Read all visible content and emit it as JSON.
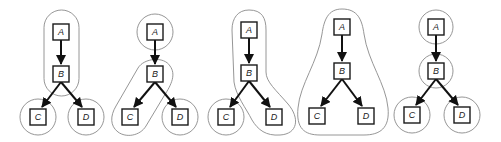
{
  "diagram": {
    "type": "graph-clusterings",
    "colors": {
      "group_outline": "#8a8a8a",
      "node_border": "#1a1a1a",
      "edge": "#111111",
      "label": "#222222"
    },
    "edges": [
      [
        "A",
        "B"
      ],
      [
        "B",
        "C"
      ],
      [
        "B",
        "D"
      ]
    ],
    "panels": [
      {
        "id": "panel-1",
        "groups": [
          [
            "A",
            "B"
          ],
          [
            "C"
          ],
          [
            "D"
          ]
        ],
        "nodes": [
          {
            "id": "A",
            "label": "A",
            "x": 61,
            "y": 32
          },
          {
            "id": "B",
            "label": "B",
            "x": 61,
            "y": 74
          },
          {
            "id": "C",
            "label": "C",
            "x": 38,
            "y": 117
          },
          {
            "id": "D",
            "label": "D",
            "x": 86,
            "y": 117
          }
        ]
      },
      {
        "id": "panel-2",
        "groups": [
          [
            "A"
          ],
          [
            "B",
            "C"
          ],
          [
            "D"
          ]
        ],
        "nodes": [
          {
            "id": "A",
            "label": "A",
            "x": 155,
            "y": 32
          },
          {
            "id": "B",
            "label": "B",
            "x": 155,
            "y": 74
          },
          {
            "id": "C",
            "label": "C",
            "x": 130,
            "y": 117
          },
          {
            "id": "D",
            "label": "D",
            "x": 180,
            "y": 117
          }
        ]
      },
      {
        "id": "panel-3",
        "groups": [
          [
            "A",
            "B",
            "D"
          ],
          [
            "C"
          ]
        ],
        "nodes": [
          {
            "id": "A",
            "label": "A",
            "x": 249,
            "y": 30
          },
          {
            "id": "B",
            "label": "B",
            "x": 249,
            "y": 73
          },
          {
            "id": "C",
            "label": "C",
            "x": 226,
            "y": 117
          },
          {
            "id": "D",
            "label": "D",
            "x": 274,
            "y": 117
          }
        ]
      },
      {
        "id": "panel-4",
        "groups": [
          [
            "A",
            "B",
            "C",
            "D"
          ]
        ],
        "nodes": [
          {
            "id": "A",
            "label": "A",
            "x": 342,
            "y": 27
          },
          {
            "id": "B",
            "label": "B",
            "x": 342,
            "y": 71
          },
          {
            "id": "C",
            "label": "C",
            "x": 317,
            "y": 116
          },
          {
            "id": "D",
            "label": "D",
            "x": 366,
            "y": 116
          }
        ]
      },
      {
        "id": "panel-5",
        "groups": [
          [
            "A"
          ],
          [
            "B"
          ],
          [
            "C"
          ],
          [
            "D"
          ]
        ],
        "nodes": [
          {
            "id": "A",
            "label": "A",
            "x": 436,
            "y": 27
          },
          {
            "id": "B",
            "label": "B",
            "x": 436,
            "y": 71
          },
          {
            "id": "C",
            "label": "C",
            "x": 412,
            "y": 115
          },
          {
            "id": "D",
            "label": "D",
            "x": 462,
            "y": 115
          }
        ]
      }
    ]
  }
}
